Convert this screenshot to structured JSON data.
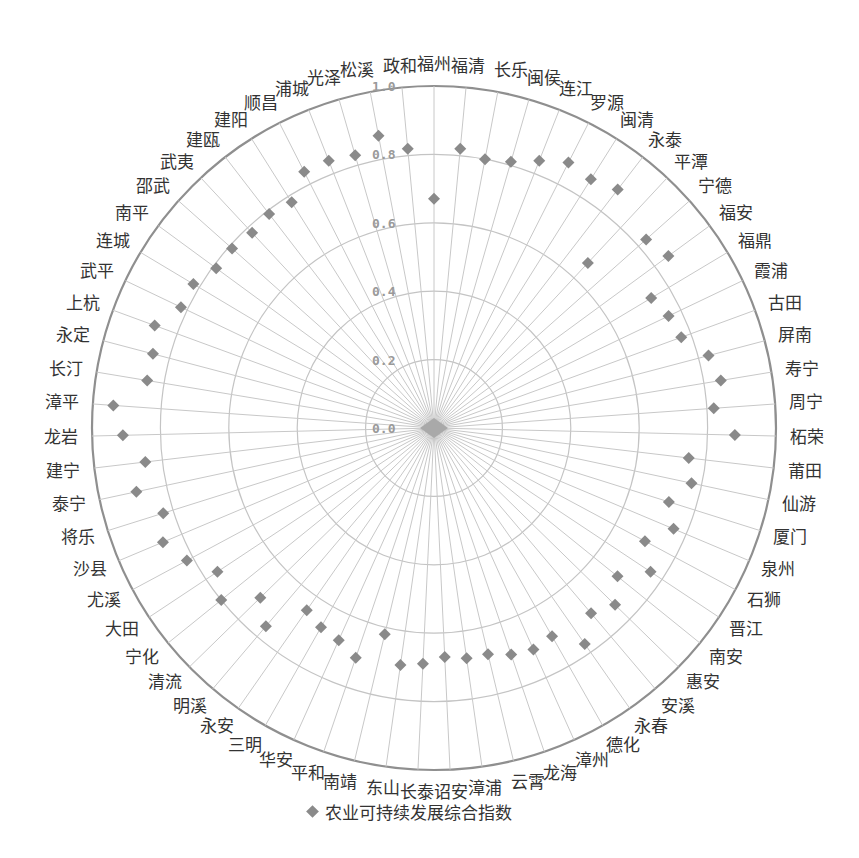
{
  "chart_data": {
    "type": "radar",
    "title": "",
    "series": [
      {
        "name": "农业可持续发展综合指数",
        "marker": "diamond",
        "color": "#8a8a8a",
        "values": [
          0.67,
          0.82,
          0.8,
          0.81,
          0.84,
          0.87,
          0.86,
          0.88,
          0.66,
          0.83,
          0.85,
          0.74,
          0.76,
          0.77,
          0.83,
          0.85,
          0.82,
          0.88,
          0.75,
          0.77,
          0.72,
          0.76,
          0.7,
          0.76,
          0.69,
          0.74,
          0.71,
          0.77,
          0.7,
          0.71,
          0.7,
          0.68,
          0.68,
          0.67,
          0.69,
          0.7,
          0.62,
          0.71,
          0.68,
          0.67,
          0.65,
          0.76,
          0.71,
          0.8,
          0.76,
          0.82,
          0.86,
          0.83,
          0.89,
          0.85,
          0.91,
          0.94,
          0.85,
          0.85,
          0.87,
          0.82,
          0.82,
          0.79,
          0.79,
          0.78,
          0.79,
          0.78,
          0.84,
          0.84,
          0.83,
          0.87,
          0.82
        ]
      }
    ],
    "categories": [
      "福州",
      "福清",
      "长乐",
      "闽侯",
      "连江",
      "罗源",
      "闽清",
      "永泰",
      "平潭",
      "宁德",
      "福安",
      "福鼎",
      "霞浦",
      "古田",
      "屏南",
      "寿宁",
      "周宁",
      "柘荣",
      "莆田",
      "仙游",
      "厦门",
      "泉州",
      "石狮",
      "晋江",
      "南安",
      "惠安",
      "安溪",
      "永春",
      "德化",
      "漳州",
      "龙海",
      "云霄",
      "漳浦",
      "诏安",
      "长泰",
      "东山",
      "南靖",
      "平和",
      "华安",
      "三明",
      "永安",
      "明溪",
      "清流",
      "宁化",
      "大田",
      "尤溪",
      "沙县",
      "将乐",
      "泰宁",
      "建宁",
      "龙岩",
      "漳平",
      "长汀",
      "永定",
      "上杭",
      "武平",
      "连城",
      "南平",
      "邵武",
      "武夷",
      "建瓯",
      "建阳",
      "顺昌",
      "浦城",
      "光泽",
      "松溪",
      "政和"
    ],
    "radial_axis": {
      "range": [
        0,
        1.0
      ],
      "ticks": [
        "0.0",
        "0.2",
        "0.4",
        "0.6",
        "0.8",
        "1.0"
      ]
    },
    "grid": true,
    "legend_position": "bottom"
  },
  "legend": {
    "label": "农业可持续发展综合指数"
  }
}
